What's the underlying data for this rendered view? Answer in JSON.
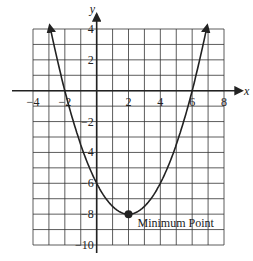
{
  "chart_data": {
    "type": "line",
    "title": "",
    "xlabel": "x",
    "ylabel": "y",
    "xlim": [
      -4,
      8
    ],
    "ylim": [
      -10,
      4
    ],
    "grid": true,
    "x_ticks": [
      "−4",
      "−2",
      "2",
      "4",
      "6",
      "8"
    ],
    "y_ticks": [
      "4",
      "2",
      "−2",
      "−4",
      "−6",
      "−8",
      "−10"
    ],
    "function": "y = 0.5(x-2)^2 - 8",
    "series": [
      {
        "name": "parabola",
        "x": [
          -3,
          -2,
          0,
          2,
          4,
          6,
          7
        ],
        "y": [
          4.5,
          0,
          -6,
          -8,
          -6,
          0,
          4.5
        ]
      }
    ],
    "annotations": [
      {
        "text": "Minimum Point",
        "x": 2,
        "y": -8
      }
    ],
    "x_intercepts": [
      -2,
      6
    ],
    "y_intercept": -6,
    "minimum_point": [
      2,
      -8
    ]
  }
}
